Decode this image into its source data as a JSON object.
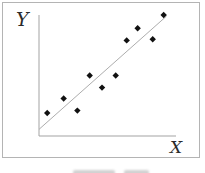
{
  "figure": {
    "ylabel": "Y",
    "xlabel": "X"
  },
  "colors": {
    "background": "#ffffff",
    "frame_border": "#b4b4b4",
    "axis": "#a3a3a3",
    "trend_line": "#adadad",
    "marker": "#111111",
    "label_text": "#2b2b2b"
  },
  "chart_data": {
    "type": "scatter",
    "title": "",
    "xlabel": "X",
    "ylabel": "Y",
    "xlim": [
      0,
      10
    ],
    "ylim": [
      0,
      10
    ],
    "grid": false,
    "legend": "none",
    "axis_tick_labels": "none",
    "marker_shape": "diamond",
    "relationship": "positive linear",
    "points": [
      {
        "x": 0.6,
        "y": 1.9
      },
      {
        "x": 1.8,
        "y": 3.1
      },
      {
        "x": 2.8,
        "y": 2.1
      },
      {
        "x": 3.7,
        "y": 5.0
      },
      {
        "x": 4.6,
        "y": 4.0
      },
      {
        "x": 5.6,
        "y": 5.0
      },
      {
        "x": 6.4,
        "y": 7.9
      },
      {
        "x": 7.2,
        "y": 8.9
      },
      {
        "x": 8.3,
        "y": 8.0
      },
      {
        "x": 9.1,
        "y": 10.0
      }
    ],
    "trendline": {
      "x1": 0.0,
      "y1": 0.55,
      "x2": 9.3,
      "y2": 9.9
    }
  }
}
